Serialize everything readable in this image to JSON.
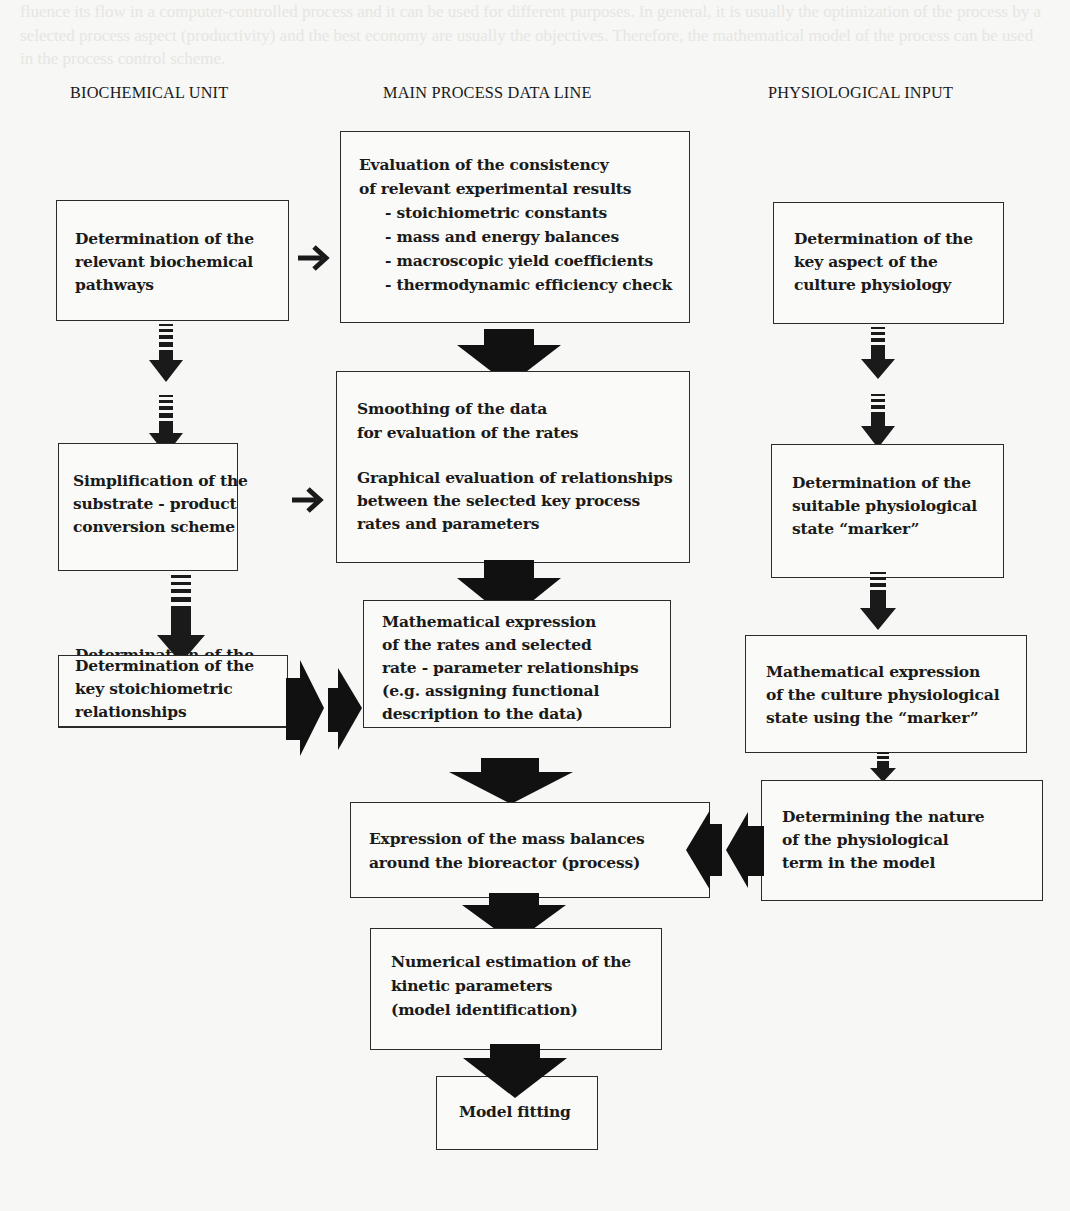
{
  "headers": {
    "biochemical": "BIOCHEMICAL UNIT",
    "main": "MAIN PROCESS DATA LINE",
    "physiological": "PHYSIOLOGICAL INPUT"
  },
  "boxes": {
    "evaluation": {
      "lines": [
        "Evaluation of the consistency",
        "of relevant experimental results"
      ],
      "bullets": [
        "- stoichiometric constants",
        "- mass and energy balances",
        "- macroscopic yield coefficients",
        "- thermodynamic efficiency check"
      ]
    },
    "biochem_pathways": [
      "Determination of the",
      "relevant biochemical",
      "pathways"
    ],
    "culture_aspect": [
      "Determination of the",
      "key aspect of the",
      "culture physiology"
    ],
    "smoothing": {
      "part1": [
        "Smoothing of the data",
        "for evaluation of the rates"
      ],
      "part2": [
        "Graphical evaluation of relationships",
        "between the selected key process",
        "rates and parameters"
      ]
    },
    "simplification": [
      "Simplification of the",
      "substrate - product",
      "conversion scheme"
    ],
    "marker_state": [
      "Determination of the",
      "suitable physiological",
      "state “marker”"
    ],
    "math_rates": [
      "Mathematical expression",
      "of the rates and selected",
      "rate - parameter relationships",
      "(e.g. assigning functional",
      "description to the data)"
    ],
    "stoich_relationships": [
      "Determination of the",
      "key stoichiometric",
      "relationships"
    ],
    "math_physio": [
      "Mathematical expression",
      "of the culture physiological",
      "state using the “marker”"
    ],
    "nature_term": [
      "Determining the nature",
      "of the physiological",
      "term in the model"
    ],
    "mass_balances": [
      "Expression of the mass balances",
      "around the bioreactor (process)"
    ],
    "numerical": [
      "Numerical estimation of the",
      "kinetic parameters",
      "(model identification)"
    ],
    "model_fitting": [
      "Model fitting"
    ]
  },
  "arrows": {
    "thin_right": "→",
    "big_down": "⬇",
    "striped_down": "striped-down-arrow",
    "double_big_right": "double-right-arrow",
    "double_big_left": "double-left-arrow"
  },
  "background_text": "fluence its flow in a computer-controlled process and it can be used for different purposes. In general, it is usually the optimization of the process by a selected process aspect (productivity) and the best economy are usually the objectives. Therefore, the mathematical model of the process can be used in the process control scheme."
}
